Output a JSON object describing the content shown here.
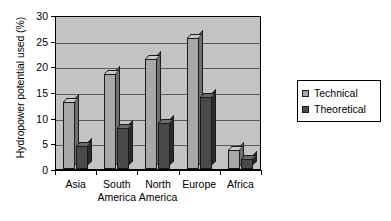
{
  "chart_data": {
    "type": "bar",
    "title": "",
    "subtitle": "",
    "xlabel": "",
    "ylabel": "Hydropower potential used (%)",
    "categories": [
      "Asia",
      "South America",
      "North America",
      "Europe",
      "Africa"
    ],
    "category_lines": [
      [
        "Asia"
      ],
      [
        "South",
        "America"
      ],
      [
        "North",
        "America"
      ],
      [
        "Europe"
      ],
      [
        "Africa"
      ]
    ],
    "series": [
      {
        "name": "Technical",
        "color": "#a8a8a8",
        "values": [
          13,
          18.5,
          21.5,
          25.5,
          3.8
        ]
      },
      {
        "name": "Theoretical",
        "color": "#4a4a4a",
        "values": [
          4.5,
          8,
          9,
          14,
          2
        ]
      }
    ],
    "ylim": [
      0,
      30
    ],
    "ytick_step": 5,
    "yticks": [
      0,
      5,
      10,
      15,
      20,
      25,
      30
    ],
    "ytick_labels": [
      "0",
      "5",
      "10",
      "15",
      "20",
      "25",
      "30"
    ],
    "grid": true,
    "grid_axis": "y",
    "legend_position": "right",
    "legend_entries": [
      "Technical",
      "Theoretical"
    ],
    "plot_background": "#c3c3c3",
    "style": "3d-column"
  }
}
